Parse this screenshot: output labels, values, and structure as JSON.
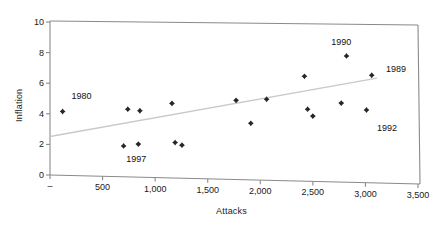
{
  "chart_data": {
    "type": "scatter",
    "title": "",
    "xlabel": "Attacks",
    "ylabel": "Inflation",
    "xlim": [
      0,
      3500
    ],
    "ylim": [
      0,
      10
    ],
    "grid": false,
    "legend": "none",
    "x_tick_labels": [
      "–",
      "500",
      "1,000",
      "1,500",
      "2,000",
      "2,500",
      "3,000",
      "3,500"
    ],
    "x_tick_values": [
      0,
      500,
      1000,
      1500,
      2000,
      2500,
      3000,
      3500
    ],
    "y_tick_labels": [
      "0",
      "2",
      "4",
      "6",
      "8",
      "10"
    ],
    "y_tick_values": [
      0,
      2,
      4,
      6,
      8,
      10
    ],
    "marker": "diamond",
    "marker_color": "#262626",
    "points": [
      {
        "x": 120,
        "y": 4.15,
        "label": "1980"
      },
      {
        "x": 700,
        "y": 1.9,
        "label": "1997"
      },
      {
        "x": 740,
        "y": 4.3,
        "label": ""
      },
      {
        "x": 840,
        "y": 2.02,
        "label": ""
      },
      {
        "x": 855,
        "y": 4.2,
        "label": ""
      },
      {
        "x": 1160,
        "y": 4.68,
        "label": ""
      },
      {
        "x": 1190,
        "y": 2.12,
        "label": ""
      },
      {
        "x": 1255,
        "y": 1.95,
        "label": ""
      },
      {
        "x": 1770,
        "y": 4.88,
        "label": ""
      },
      {
        "x": 1910,
        "y": 3.38,
        "label": ""
      },
      {
        "x": 2060,
        "y": 4.95,
        "label": ""
      },
      {
        "x": 2420,
        "y": 6.45,
        "label": ""
      },
      {
        "x": 2450,
        "y": 4.3,
        "label": ""
      },
      {
        "x": 2500,
        "y": 3.85,
        "label": ""
      },
      {
        "x": 2770,
        "y": 4.7,
        "label": ""
      },
      {
        "x": 2820,
        "y": 7.78,
        "label": "1990"
      },
      {
        "x": 3010,
        "y": 4.25,
        "label": "1992"
      },
      {
        "x": 3060,
        "y": 6.52,
        "label": "1989"
      }
    ],
    "trendline": {
      "color": "#c9c9c9",
      "x_start": 0,
      "y_start": 2.52,
      "x_end": 3110,
      "y_end": 6.33
    },
    "annotations": [
      {
        "text": "1980",
        "x": 310,
        "y": 5.15
      },
      {
        "text": "1997",
        "x": 830,
        "y": 1.05
      },
      {
        "text": "1990",
        "x": 2780,
        "y": 8.68
      },
      {
        "text": "1989",
        "x": 3300,
        "y": 6.9
      },
      {
        "text": "1992",
        "x": 3215,
        "y": 3.1
      }
    ]
  }
}
